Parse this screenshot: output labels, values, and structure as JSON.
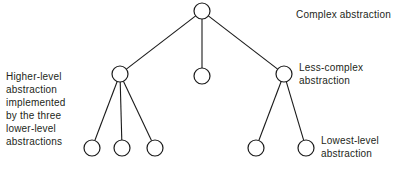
{
  "diagram": {
    "background_color": "#ffffff",
    "stroke_color": "#1a1a1a",
    "text_color": "#231f20",
    "node_fill_color": "#ffffff",
    "node_radius": 8,
    "nodes": [
      {
        "id": "root",
        "level": "complex",
        "cx": 202,
        "cy": 11,
        "r": 8
      },
      {
        "id": "m1",
        "level": "less-complex",
        "cx": 120,
        "cy": 74,
        "r": 8
      },
      {
        "id": "m2",
        "level": "less-complex",
        "cx": 202,
        "cy": 76,
        "r": 8
      },
      {
        "id": "m3",
        "level": "less-complex",
        "cx": 284,
        "cy": 74,
        "r": 8
      },
      {
        "id": "l1",
        "level": "lowest",
        "cx": 92,
        "cy": 148,
        "r": 8
      },
      {
        "id": "l2",
        "level": "lowest",
        "cx": 122,
        "cy": 148,
        "r": 8
      },
      {
        "id": "l3",
        "level": "lowest",
        "cx": 155,
        "cy": 148,
        "r": 8
      },
      {
        "id": "l4",
        "level": "lowest",
        "cx": 256,
        "cy": 148,
        "r": 8
      },
      {
        "id": "l5",
        "level": "lowest",
        "cx": 306,
        "cy": 148,
        "r": 8
      }
    ],
    "edges": [
      {
        "from": "root",
        "to": "m1"
      },
      {
        "from": "root",
        "to": "m2"
      },
      {
        "from": "root",
        "to": "m3"
      },
      {
        "from": "m1",
        "to": "l1"
      },
      {
        "from": "m1",
        "to": "l2"
      },
      {
        "from": "m1",
        "to": "l3"
      },
      {
        "from": "m3",
        "to": "l4"
      },
      {
        "from": "m3",
        "to": "l5"
      }
    ],
    "labels": {
      "complex": "Complex abstraction",
      "less_complex": "Less-complex\nabstraction",
      "lowest": "Lowest-level\nabstraction",
      "higher_level": "Higher-level\nabstraction\nimplemented\nby the three\nlower-level\nabstractions"
    }
  }
}
